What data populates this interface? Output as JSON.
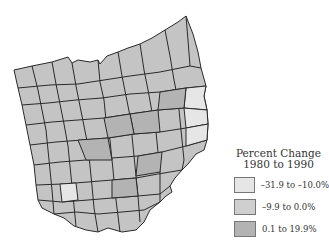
{
  "map": {
    "region": "Ohio counties",
    "border_color": "#2a2a2a",
    "county_fill_default": "#c4c4c4",
    "highlighted_counties_light": [
      "east-border-1",
      "east-border-2",
      "east-border-3",
      "southwest-1"
    ]
  },
  "legend": {
    "title_line1": "Percent Change",
    "title_line2": "1980 to 1990",
    "items": [
      {
        "label": "–31.9 to –10.0%",
        "color": "#e6e6e6"
      },
      {
        "label": "–9.9 to 0.0%",
        "color": "#cfcfcf"
      },
      {
        "label": "0.1 to 19.9%",
        "color": "#b3b3b3"
      }
    ]
  }
}
